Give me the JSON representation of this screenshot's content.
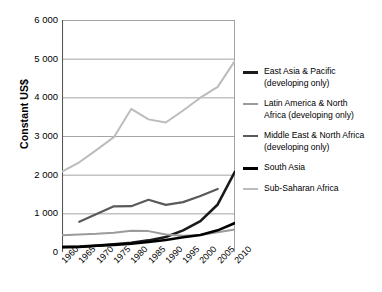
{
  "chart_data": {
    "type": "line",
    "title": "",
    "subtitle": "",
    "xlabel": "",
    "ylabel": "Constant US$",
    "xlim": [
      1960,
      2010
    ],
    "ylim": [
      0,
      6000
    ],
    "yticks": [
      "0",
      "1 000",
      "2 000",
      "3 000",
      "4 000",
      "5 000",
      "6 000"
    ],
    "ytick_values": [
      0,
      1000,
      2000,
      3000,
      4000,
      5000,
      6000
    ],
    "xticks": [
      "1960",
      "1965",
      "1970",
      "1975",
      "1980",
      "1985",
      "1990",
      "1995",
      "2000",
      "2005",
      "2010"
    ],
    "xtick_values": [
      1960,
      1965,
      1970,
      1975,
      1980,
      1985,
      1990,
      1995,
      2000,
      2005,
      2010
    ],
    "grid": "horizontal",
    "legend_position": "right",
    "series": [
      {
        "name": "East Asia & Pacific (developing only)",
        "legend_line1": "East Asia & Pacific",
        "legend_line2": "(developing only)",
        "color": "#1a1a1a",
        "width": 2.6,
        "x": [
          1960,
          1965,
          1970,
          1975,
          1980,
          1985,
          1990,
          1995,
          2000,
          2005,
          2010
        ],
        "values": [
          130,
          140,
          165,
          200,
          240,
          300,
          390,
          560,
          800,
          1230,
          2080
        ]
      },
      {
        "name": "Latin America & North Africa (developing only)",
        "legend_line1": "Latin America & North",
        "legend_line2": "Africa (developing only)",
        "color": "#9b9b9b",
        "width": 2.0,
        "x": [
          1960,
          1965,
          1970,
          1975,
          1980,
          1985,
          1990,
          1995,
          2000,
          2005,
          2010
        ],
        "values": [
          430,
          450,
          470,
          500,
          550,
          540,
          450,
          420,
          440,
          510,
          580
        ]
      },
      {
        "name": "Middle East & North Africa (developing only)",
        "legend_line1": "Middle East & North Africa",
        "legend_line2": "(developing only)",
        "color": "#5a5a5a",
        "width": 2.2,
        "x": [
          1965,
          1970,
          1975,
          1980,
          1985,
          1990,
          1995,
          2000,
          2005
        ],
        "values": [
          780,
          980,
          1180,
          1185,
          1350,
          1220,
          1290,
          1450,
          1630
        ]
      },
      {
        "name": "South Asia",
        "legend_line1": "South Asia",
        "legend_line2": "",
        "color": "#000000",
        "width": 2.6,
        "x": [
          1960,
          1965,
          1970,
          1975,
          1980,
          1985,
          1990,
          1995,
          2000,
          2005,
          2010
        ],
        "values": [
          125,
          130,
          160,
          185,
          215,
          260,
          310,
          380,
          440,
          560,
          750
        ]
      },
      {
        "name": "Sub-Saharan Africa",
        "legend_line1": "Sub-Saharan Africa",
        "legend_line2": "",
        "color": "#bcbcbc",
        "width": 2.0,
        "x": [
          1960,
          1965,
          1970,
          1975,
          1980,
          1985,
          1990,
          1995,
          2000,
          2005,
          2010
        ],
        "values": [
          2080,
          2320,
          2640,
          2970,
          3700,
          3430,
          3350,
          3660,
          3990,
          4270,
          4950
        ]
      }
    ]
  },
  "axis": {
    "y_title": "Constant US$"
  }
}
